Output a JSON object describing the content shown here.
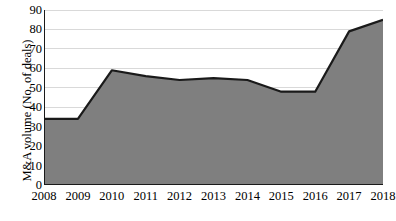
{
  "chart_data": {
    "type": "area",
    "title": "",
    "xlabel": "",
    "ylabel": "M&A volume (No. of deals)",
    "categories": [
      "2008",
      "2009",
      "2010",
      "2011",
      "2012",
      "2013",
      "2014",
      "2015",
      "2016",
      "2017",
      "2018"
    ],
    "values": [
      34,
      34,
      59,
      56,
      54,
      55,
      54,
      48,
      48,
      79,
      85
    ],
    "series": [
      {
        "name": "M&A volume",
        "values": [
          34,
          34,
          59,
          56,
          54,
          55,
          54,
          48,
          48,
          79,
          85
        ]
      }
    ],
    "ylim": [
      0,
      90
    ],
    "y_ticks": [
      0,
      10,
      20,
      30,
      40,
      50,
      60,
      70,
      80,
      90
    ],
    "y_tick_labels": [
      "0",
      "10",
      "20",
      "30",
      "40",
      "50",
      "60",
      "70",
      "80",
      "90"
    ],
    "x_tick_labels": [
      "2008",
      "2009",
      "2010",
      "2011",
      "2012",
      "2013",
      "2014",
      "2015",
      "2016",
      "2017",
      "2018"
    ],
    "grid": true,
    "grid_axis": "y",
    "legend": false,
    "legend_position": "none",
    "colors": {
      "fill": "#7f7f7f",
      "line": "#1a1a1a",
      "grid": "#d9d9d9",
      "axis": "#1a1a1a",
      "text": "#000000",
      "background": "#ffffff"
    }
  }
}
